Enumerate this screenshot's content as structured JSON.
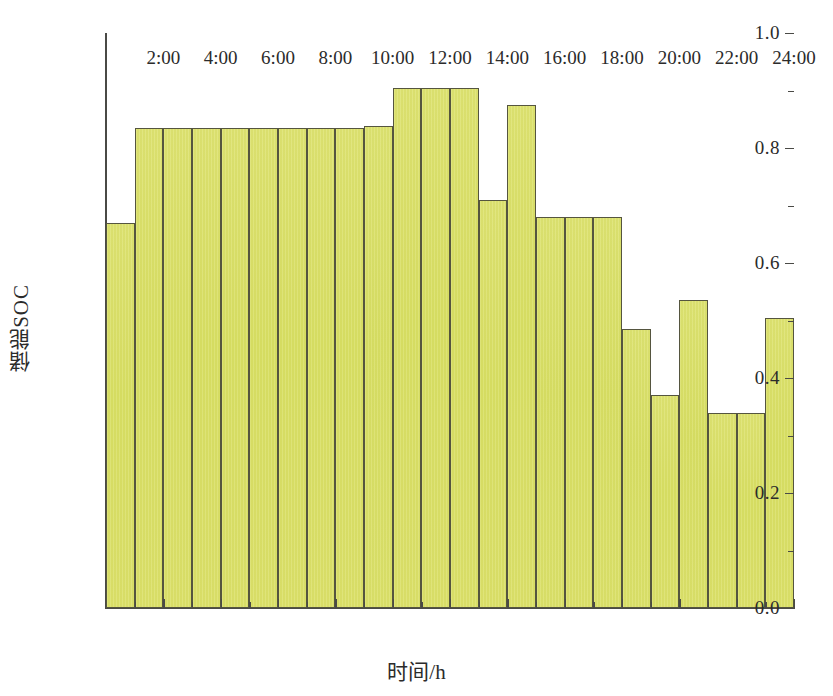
{
  "chart_data": {
    "type": "bar",
    "title": "",
    "xlabel": "时间/h",
    "ylabel": "储能SOC",
    "ylim": [
      0.0,
      1.0
    ],
    "xlim": [
      0,
      24
    ],
    "grid": false,
    "legend": null,
    "y_ticks": [
      "0.0",
      "0.2",
      "0.4",
      "0.6",
      "0.8",
      "1.0"
    ],
    "y_tick_values": [
      0.0,
      0.2,
      0.4,
      0.6,
      0.8,
      1.0
    ],
    "y_minor_tick_values": [
      0.1,
      0.3,
      0.5,
      0.7,
      0.9
    ],
    "x_ticks": [
      "2:00",
      "4:00",
      "6:00",
      "8:00",
      "10:00",
      "12:00",
      "14:00",
      "16:00",
      "18:00",
      "20:00",
      "22:00",
      "24:00"
    ],
    "x_tick_values": [
      2,
      4,
      6,
      8,
      10,
      12,
      14,
      16,
      18,
      20,
      22,
      24
    ],
    "bar_color": "#d9e069",
    "bar_edge_color": "#55553f",
    "categories": [
      "1:00",
      "2:00",
      "3:00",
      "4:00",
      "5:00",
      "6:00",
      "7:00",
      "8:00",
      "9:00",
      "10:00",
      "11:00",
      "12:00",
      "13:00",
      "14:00",
      "15:00",
      "16:00",
      "17:00",
      "18:00",
      "19:00",
      "20:00",
      "21:00",
      "22:00",
      "23:00",
      "24:00"
    ],
    "values": [
      0.67,
      0.835,
      0.835,
      0.835,
      0.835,
      0.835,
      0.835,
      0.835,
      0.835,
      0.838,
      0.905,
      0.905,
      0.905,
      0.71,
      0.875,
      0.68,
      0.68,
      0.68,
      0.485,
      0.37,
      0.535,
      0.34,
      0.34,
      0.505
    ]
  }
}
